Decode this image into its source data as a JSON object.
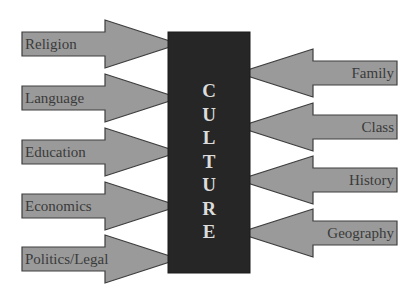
{
  "diagram": {
    "center": {
      "label": "CULTURE"
    },
    "left_factors": [
      {
        "label": "Religion"
      },
      {
        "label": "Language"
      },
      {
        "label": "Education"
      },
      {
        "label": "Economics"
      },
      {
        "label": "Politics/Legal"
      }
    ],
    "right_factors": [
      {
        "label": "Family"
      },
      {
        "label": "Class"
      },
      {
        "label": "History"
      },
      {
        "label": "Geography"
      }
    ],
    "colors": {
      "arrow_fill": "#9a9a9a",
      "arrow_stroke": "#3e3e3e",
      "center_box": "#262626",
      "center_text": "#dcdcdc",
      "label_text": "#3a3a3a"
    }
  }
}
